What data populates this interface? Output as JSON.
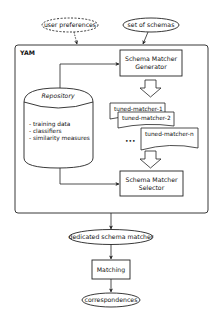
{
  "diagram": {
    "container": {
      "label": "YAM"
    },
    "inputs": {
      "user_preferences": "user preferences",
      "set_of_schemas": "set of schemas"
    },
    "repository": {
      "title": "Repository",
      "items": [
        "- training data",
        "- classifiers",
        "- similarity measures"
      ]
    },
    "generator": {
      "line1": "Schema Matcher",
      "line2": "Generator"
    },
    "tuned_matchers": [
      "tuned-matcher-1",
      "tuned-matcher-2",
      "tuned-matcher-n"
    ],
    "ellipsis": "•••",
    "selector": {
      "line1": "Schema Matcher",
      "line2": "Selector"
    },
    "dedicated": "dedicated schema matcher",
    "matching": "Matching",
    "correspondences": "correspondences"
  },
  "colors": {
    "stroke": "#222222",
    "background": "#ffffff"
  }
}
